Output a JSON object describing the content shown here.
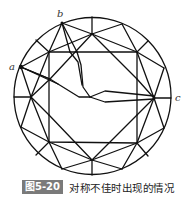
{
  "figure": {
    "labels": {
      "a": "a",
      "b": "b",
      "c": "c"
    },
    "caption_number": "图5-20",
    "caption_text": "对称不佳时出现的情况",
    "stroke_color": "#111111",
    "caption_badge_color": "#7a7a7a"
  }
}
